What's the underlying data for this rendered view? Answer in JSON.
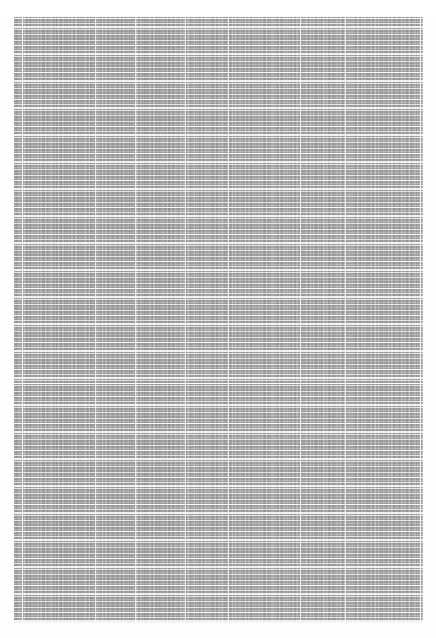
{
  "page": {
    "background_color": "#fefefe",
    "width": 436,
    "height": 638,
    "document_type": "data-table"
  },
  "header": {
    "left_text": "",
    "center_text": "",
    "center_text_2": "",
    "right_text": ""
  },
  "sheet": {
    "x": 14,
    "y": 16,
    "width": 409,
    "height": 607,
    "fill_color": "#9d9d9d",
    "gridline_color": "#ffffff",
    "legible": false,
    "note": "",
    "row_pitch_px": 5.4,
    "band_gap_pitch_px": 27,
    "major_rule_y": 367,
    "column_dividers_x": [
      8,
      81,
      121,
      171,
      214,
      286,
      331,
      406
    ],
    "row_line_count": 112
  },
  "chart_data": {
    "type": "table",
    "title": "",
    "columns": [],
    "rows": [],
    "legible": false
  }
}
